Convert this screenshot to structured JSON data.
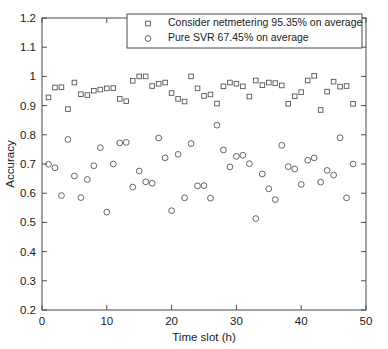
{
  "chart_data": {
    "type": "scatter",
    "title": "",
    "xlabel": "Time slot (h)",
    "ylabel": "Accuracy",
    "xlim": [
      0,
      50
    ],
    "ylim": [
      0.2,
      1.2
    ],
    "xticks": [
      0,
      10,
      20,
      30,
      40,
      50
    ],
    "xtick_labels": [
      "0",
      "10",
      "20",
      "30",
      "40",
      "50"
    ],
    "yticks": [
      0.2,
      0.3,
      0.4,
      0.5,
      0.6,
      0.7,
      0.8,
      0.9,
      1.0,
      1.1,
      1.2
    ],
    "ytick_labels": [
      "0.2",
      "0.3",
      "0.4",
      "0.5",
      "0.6",
      "0.7",
      "0.8",
      "0.9",
      "1",
      "1.1",
      "1.2"
    ],
    "grid": false,
    "legend_position": "top-center",
    "series": [
      {
        "name": "Consider netmetering 95.35% on average",
        "marker": "square",
        "marker_name": "open-square-marker",
        "color": "#555555",
        "x": [
          1,
          2,
          3,
          4,
          5,
          6,
          7,
          8,
          9,
          10,
          11,
          12,
          13,
          14,
          15,
          16,
          17,
          18,
          19,
          20,
          21,
          22,
          23,
          24,
          25,
          26,
          27,
          28,
          29,
          30,
          31,
          32,
          33,
          34,
          35,
          36,
          37,
          38,
          39,
          40,
          41,
          42,
          43,
          44,
          45,
          46,
          47,
          48
        ],
        "y": [
          0.928,
          0.962,
          0.963,
          0.888,
          0.979,
          0.939,
          0.936,
          0.951,
          0.955,
          0.959,
          0.96,
          0.923,
          0.915,
          0.985,
          1.0,
          1.0,
          0.967,
          0.975,
          0.979,
          0.943,
          0.923,
          0.914,
          1.0,
          0.959,
          0.933,
          0.938,
          0.907,
          0.966,
          0.979,
          0.975,
          0.966,
          0.931,
          0.986,
          0.97,
          0.979,
          0.977,
          0.969,
          0.906,
          0.932,
          0.946,
          0.986,
          1.002,
          0.885,
          0.948,
          0.982,
          0.965,
          0.967,
          0.906
        ]
      },
      {
        "name": "Pure SVR 67.45% on average",
        "marker": "circle",
        "marker_name": "open-circle-marker",
        "color": "#555555",
        "x": [
          1,
          2,
          3,
          4,
          5,
          6,
          7,
          8,
          9,
          10,
          11,
          12,
          13,
          14,
          15,
          16,
          17,
          18,
          19,
          20,
          21,
          22,
          23,
          24,
          25,
          26,
          27,
          28,
          29,
          30,
          31,
          32,
          33,
          34,
          35,
          36,
          37,
          38,
          39,
          40,
          41,
          42,
          43,
          44,
          45,
          46,
          47,
          48
        ],
        "y": [
          0.699,
          0.687,
          0.592,
          0.784,
          0.659,
          0.585,
          0.647,
          0.694,
          0.756,
          0.535,
          0.7,
          0.772,
          0.774,
          0.621,
          0.676,
          0.639,
          0.634,
          0.789,
          0.721,
          0.54,
          0.733,
          0.584,
          0.77,
          0.625,
          0.626,
          0.583,
          0.833,
          0.748,
          0.69,
          0.726,
          0.73,
          0.701,
          0.513,
          0.666,
          0.615,
          0.578,
          0.764,
          0.691,
          0.683,
          0.63,
          0.713,
          0.721,
          0.638,
          0.678,
          0.662,
          0.79,
          0.584,
          0.7
        ]
      }
    ]
  },
  "legend": {
    "entries": [
      {
        "label": "Consider netmetering 95.35% on average",
        "marker": "square"
      },
      {
        "label": "Pure SVR 67.45% on average",
        "marker": "circle"
      }
    ]
  }
}
